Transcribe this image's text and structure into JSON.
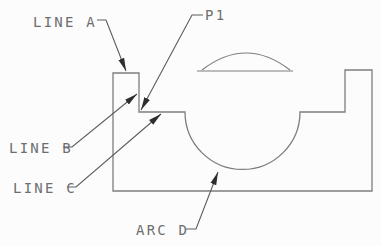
{
  "diagram": {
    "labels": {
      "line_a": "LINE A",
      "p1": "P1",
      "line_b": "LINE B",
      "line_c": "LINE C",
      "arc_d": "ARC D"
    },
    "colors": {
      "background": "#fcfcfc",
      "outline": "#7d7d7d",
      "leader": "#5c5c5c",
      "text": "#6e6e6e",
      "arrowhead": "#2e2e2e"
    }
  }
}
